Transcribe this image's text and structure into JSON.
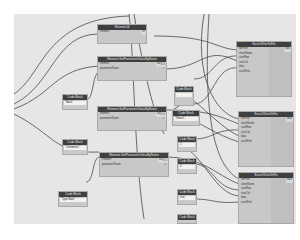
{
  "canvas": {
    "background": "#e6e6e6",
    "wire_color": "#4a4a4a",
    "header_color": "#3f3f3f"
  },
  "nodes": {
    "element_id": {
      "title": "Element.Id",
      "inputs": [
        "element"
      ],
      "output": "int"
    },
    "gpv1": {
      "title": "Element.GetParameterValueByName",
      "inputs": [
        "element",
        "parameterName"
      ],
      "output": "var[]..[]"
    },
    "gpv2": {
      "title": "Element.GetParameterValueByName",
      "inputs": [
        "element",
        "parameterName"
      ],
      "output": "var[]..[]"
    },
    "gpv3": {
      "title": "Element.GetParameterValueByName",
      "inputs": [
        "element",
        "parameterName"
      ],
      "output": "var[]..[]"
    },
    "cb_left1": {
      "title": "Code Block",
      "code": "\"Mark\";"
    },
    "cb_left2": {
      "title": "Code Block",
      "code": "\"Comments\";"
    },
    "cb_left3": {
      "title": "Code Block",
      "code": "\"Type Mark\";"
    },
    "cb_mid": [
      {
        "title": "Code Block",
        "code": ""
      },
      {
        "title": "Code Block",
        "code": "\"Sheet1\";"
      },
      {
        "title": "Code Block",
        "code": "1;"
      },
      {
        "title": "Code Block",
        "code": "0;"
      },
      {
        "title": "Code Block",
        "code": "true;"
      },
      {
        "title": "Code Block",
        "code": "1;"
      }
    ],
    "excel": [
      {
        "title": "Excel.WriteToFile",
        "inputs": [
          "filePath",
          "sheetName",
          "startRow",
          "startCol",
          "data",
          "overWrite"
        ],
        "output": "data"
      },
      {
        "title": "Excel.WriteToFile",
        "inputs": [
          "filePath",
          "sheetName",
          "startRow",
          "startCol",
          "data",
          "overWrite"
        ],
        "output": "data"
      },
      {
        "title": "Excel.WriteToFile",
        "inputs": [
          "filePath",
          "sheetName",
          "startRow",
          "startCol",
          "data",
          "overWrite"
        ],
        "output": "data"
      }
    ]
  }
}
